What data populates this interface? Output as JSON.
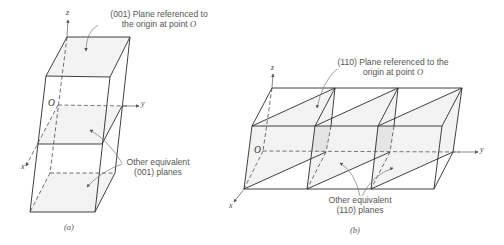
{
  "figure": {
    "panel_a": {
      "caption": "(a)",
      "axes": {
        "x": "x",
        "y": "y",
        "z": "z"
      },
      "origin_label": "O",
      "label_plane": {
        "line1": "(001) Plane referenced to",
        "line2_prefix": "the origin at point ",
        "line2_point": "O"
      },
      "label_equivalent": {
        "line1": "Other equivalent",
        "line2": "(001) planes"
      }
    },
    "panel_b": {
      "caption": "(b)",
      "axes": {
        "x": "x",
        "y": "y",
        "z": "z"
      },
      "origin_label": "O",
      "label_plane": {
        "line1": "(110) Plane referenced to the",
        "line2_prefix": "origin at point ",
        "line2_point": "O"
      },
      "label_equivalent": {
        "line1": "Other equivalent",
        "line2": "(110) planes"
      }
    },
    "colors": {
      "edge": "#2b2b2b",
      "text": "#555555",
      "plane_fill": "#f3f3f3",
      "plane_shade": "#e4e4e4"
    }
  }
}
